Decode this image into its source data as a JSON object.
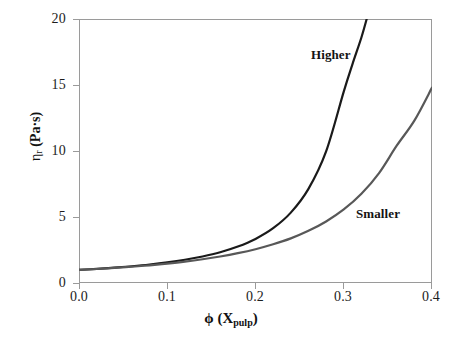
{
  "figure": {
    "background_color": "#ffffff",
    "frame_color": "#9a9a9a",
    "width": 462,
    "height": 343
  },
  "axes": {
    "y_title_eta": "η",
    "y_title_sub": "r",
    "y_title_units": " (Pa·s)",
    "y_title_full": "ηr (Pa·s)",
    "x_title_phi": "ϕ",
    "x_title_open": " (X",
    "x_title_sub": "pulp",
    "x_title_close": ")",
    "x_title_full": "ϕ (Xpulp)",
    "y_ticks": [
      "0",
      "5",
      "10",
      "15",
      "20"
    ],
    "x_ticks": [
      "0.0",
      "0.1",
      "0.2",
      "0.3",
      "0.4"
    ]
  },
  "annotations": {
    "higher": "Higher",
    "smaller": "Smaller"
  },
  "chart_data": {
    "type": "line",
    "title": "",
    "subtitle": "",
    "xlabel": "ϕ (Xpulp)",
    "ylabel": "ηr (Pa·s)",
    "xlim": [
      0.0,
      0.4
    ],
    "ylim": [
      0,
      20
    ],
    "xticks": [
      0.0,
      0.1,
      0.2,
      0.3,
      0.4
    ],
    "yticks": [
      0,
      5,
      10,
      15,
      20
    ],
    "grid": false,
    "legend": "none",
    "legend_position": "inline-annotation",
    "annotations": [
      {
        "text": "Higher",
        "x": 0.275,
        "y": 17.4
      },
      {
        "text": "Smaller",
        "x": 0.325,
        "y": 5.5
      }
    ],
    "series": [
      {
        "name": "Higher",
        "label": "Higher",
        "color": "#1a1a1a",
        "linewidth": 2.2,
        "description": "Higher aspect-ratio / coarser fibre suspension: relative viscosity diverges near ϕ = 0.33",
        "x": [
          0.0,
          0.02,
          0.04,
          0.06,
          0.08,
          0.1,
          0.12,
          0.14,
          0.16,
          0.18,
          0.2,
          0.22,
          0.24,
          0.26,
          0.28,
          0.3,
          0.31,
          0.32,
          0.326
        ],
        "y": [
          1.0,
          1.07,
          1.16,
          1.27,
          1.4,
          1.56,
          1.76,
          2.01,
          2.33,
          2.76,
          3.34,
          4.15,
          5.33,
          7.13,
          9.97,
          14.5,
          16.6,
          18.6,
          20.0
        ]
      },
      {
        "name": "Smaller",
        "label": "Smaller",
        "color": "#585858",
        "linewidth": 2.2,
        "description": "Smaller aspect-ratio / finer fibre suspension: reaches ηr ≈ 14.8 at ϕ = 0.4",
        "x": [
          0.0,
          0.02,
          0.04,
          0.06,
          0.08,
          0.1,
          0.12,
          0.14,
          0.16,
          0.18,
          0.2,
          0.22,
          0.24,
          0.26,
          0.28,
          0.3,
          0.32,
          0.34,
          0.36,
          0.38,
          0.4
        ],
        "y": [
          1.0,
          1.06,
          1.14,
          1.23,
          1.34,
          1.47,
          1.62,
          1.8,
          2.01,
          2.26,
          2.56,
          2.93,
          3.38,
          3.95,
          4.66,
          5.57,
          6.76,
          8.33,
          10.4,
          12.3,
          14.8
        ]
      }
    ]
  }
}
